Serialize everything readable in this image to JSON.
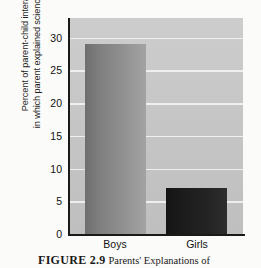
{
  "chart_data": {
    "type": "bar",
    "title": "",
    "categories": [
      "Boys",
      "Girls"
    ],
    "values": [
      29,
      7
    ],
    "series": [
      {
        "name": "Percent of parent-child interactions",
        "values": [
          29,
          7
        ]
      }
    ],
    "xlabel": "",
    "ylabel": "Percent of parent-child interactions in which parent explained science concepts",
    "ylabel_lines": [
      "Percent of parent-child interactions",
      "in which parent explained science concepts"
    ],
    "ylim": [
      0,
      33
    ],
    "yticks": [
      0,
      5,
      10,
      15,
      20,
      25,
      30
    ],
    "ytick_labels": [
      "0",
      "5",
      "10",
      "15",
      "20",
      "25",
      "30"
    ],
    "grid": true,
    "legend": false,
    "bar_colors": [
      "#8d8d8d",
      "#1e1e1e"
    ],
    "panel_color": "#c6c6c6",
    "gridline_color": "#f2f2f0",
    "axis_color": "#1a1a1a"
  },
  "caption": {
    "label": "FIGURE 2.9",
    "text": "Parents' Explanations of"
  }
}
